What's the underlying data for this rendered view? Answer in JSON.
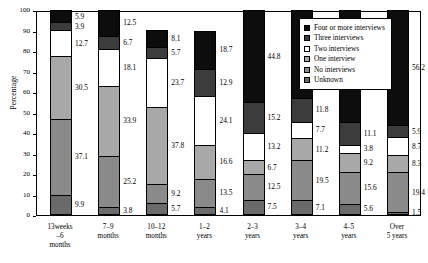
{
  "chart_data": {
    "type": "bar",
    "subtype": "stacked-percentage",
    "title": "",
    "xlabel": "",
    "ylabel": "Percentage",
    "ylim": [
      0,
      100
    ],
    "yticks": [
      0,
      10,
      20,
      30,
      40,
      50,
      60,
      70,
      80,
      90,
      100
    ],
    "grid": false,
    "legend_position": "top-right-inset",
    "categories": [
      "13weeks\n–6\nmonths",
      "7–9\nmonths",
      "10–12\nmonths",
      "1–2\nyears",
      "2–3\nyears",
      "3–4\nyears",
      "4–5\nyears",
      "Over\n5 years"
    ],
    "category_lines": [
      [
        "13weeks",
        "–6",
        "months"
      ],
      [
        "7–9",
        "months"
      ],
      [
        "10–12",
        "months"
      ],
      [
        "1–2",
        "years"
      ],
      [
        "2–3",
        "years"
      ],
      [
        "3–4",
        "years"
      ],
      [
        "4–5",
        "years"
      ],
      [
        "Over",
        "5 years"
      ]
    ],
    "series": [
      {
        "name": "Unknown",
        "color": "#6a6a6a",
        "values": [
          9.9,
          3.8,
          5.7,
          4.1,
          7.5,
          7.1,
          5.6,
          1.5
        ]
      },
      {
        "name": "No interviews",
        "color": "#8a8a8a",
        "values": [
          37.1,
          25.2,
          9.2,
          13.5,
          12.5,
          19.5,
          15.6,
          19.4
        ]
      },
      {
        "name": "One interview",
        "color": "#a8a8a8",
        "values": [
          30.5,
          33.9,
          37.8,
          16.6,
          6.7,
          11.2,
          9.2,
          8.3
        ]
      },
      {
        "name": "Two interviews",
        "color": "#ffffff",
        "values": [
          12.7,
          18.1,
          23.7,
          24.1,
          13.2,
          7.7,
          3.8,
          8.7
        ]
      },
      {
        "name": "Three interviews",
        "color": "#3c3c3c",
        "values": [
          3.9,
          6.7,
          5.7,
          12.9,
          15.2,
          11.8,
          11.1,
          5.9
        ]
      },
      {
        "name": "Four or more interviews",
        "color": "#0d0d0d",
        "values": [
          5.9,
          12.5,
          8.1,
          18.7,
          44.8,
          42.7,
          54.6,
          56.2
        ]
      }
    ]
  },
  "legend": {
    "items": [
      {
        "label": "Four or more interviews",
        "color": "#0d0d0d",
        "style": "solid"
      },
      {
        "label": "Three interviews",
        "color": "#3c3c3c",
        "style": "solid"
      },
      {
        "label": "Two interviews",
        "color": "#ffffff",
        "style": "solid"
      },
      {
        "label": "One interview",
        "color": "#a8a8a8",
        "style": "hatch"
      },
      {
        "label": "No interviews",
        "color": "#8a8a8a",
        "style": "hatch"
      },
      {
        "label": "Unknown",
        "color": "#6a6a6a",
        "style": "solid"
      }
    ]
  }
}
